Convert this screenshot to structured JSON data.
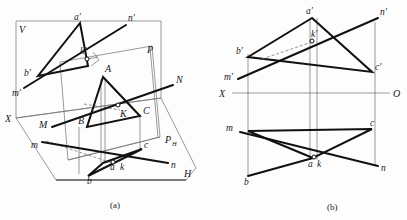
{
  "figure": {
    "title": "",
    "captions": [
      {
        "id": "caption-a",
        "text": "(a)",
        "x": 116,
        "y": 205
      },
      {
        "id": "caption-b",
        "text": "(b)",
        "x": 332,
        "y": 207
      }
    ]
  },
  "colors": {
    "background": "#fdfdfd",
    "thin_line": "#6f6f6f",
    "medium_line": "#2b2b2b",
    "heavy_line": "#111111",
    "hidden_line": "#7a7a7a",
    "text": "#1a1a1a"
  },
  "diagram_a": {
    "name": "pictorial-projection-view",
    "description": "Pictorial view showing V plane, H plane, auxiliary plane P, triangle ABC, line MN and intersection point K",
    "plane_labels": [
      {
        "id": "label-V",
        "text": "V",
        "x": 19,
        "y": 30
      },
      {
        "id": "label-H",
        "text": "H",
        "x": 184,
        "y": 177
      },
      {
        "id": "label-X",
        "text": "X",
        "x": 6,
        "y": 120
      },
      {
        "id": "label-P",
        "text": "P",
        "x": 148,
        "y": 51
      },
      {
        "id": "label-PH",
        "text": "P",
        "x": 167,
        "y": 141,
        "sub": "H"
      }
    ],
    "space_points": [
      {
        "id": "point-A",
        "text": "A",
        "x": 102,
        "y": 72
      },
      {
        "id": "point-B",
        "text": "B",
        "x": 81,
        "y": 121
      },
      {
        "id": "point-C",
        "text": "C",
        "x": 142,
        "y": 112
      },
      {
        "id": "point-K",
        "text": "K",
        "x": 123,
        "y": 113
      },
      {
        "id": "point-M",
        "text": "M",
        "x": 42,
        "y": 125
      },
      {
        "id": "point-N",
        "text": "N",
        "x": 176,
        "y": 89
      }
    ],
    "v_projection_points": [
      {
        "id": "point-a-prime",
        "text": "a′",
        "x": 76,
        "y": 17
      },
      {
        "id": "point-b-prime",
        "text": "b′",
        "x": 26,
        "y": 73
      },
      {
        "id": "point-k-prime",
        "text": "k′",
        "x": 80,
        "y": 58
      },
      {
        "id": "point-m-prime",
        "text": "m′",
        "x": 14,
        "y": 93
      },
      {
        "id": "point-n-prime",
        "text": "n′",
        "x": 129,
        "y": 18
      }
    ],
    "h_projection_points": [
      {
        "id": "point-a-lower",
        "text": "a",
        "x": 114,
        "y": 166
      },
      {
        "id": "point-k-lower",
        "text": "k",
        "x": 123,
        "y": 166
      },
      {
        "id": "point-b-lower",
        "text": "b",
        "x": 90,
        "y": 180
      },
      {
        "id": "point-c-lower",
        "text": "c",
        "x": 145,
        "y": 152
      },
      {
        "id": "point-m-lower",
        "text": "m",
        "x": 33,
        "y": 146
      },
      {
        "id": "point-n-lower",
        "text": "n",
        "x": 172,
        "y": 168
      }
    ]
  },
  "diagram_b": {
    "name": "orthographic-projection-view",
    "description": "Two-view orthographic projection: front (V) view above X-O axis and top (H) view below",
    "axis": {
      "id": "axis-XO",
      "left_label": "X",
      "right_label": "O",
      "left_label_x": 221,
      "right_label_x": 394,
      "label_y": 96,
      "y": 93,
      "x_start": 232,
      "x_end": 390
    },
    "v_projection_points": [
      {
        "id": "point-a-prime",
        "text": "a′",
        "x": 307,
        "y": 12
      },
      {
        "id": "point-b-prime",
        "text": "b′",
        "x": 239,
        "y": 50
      },
      {
        "id": "point-c-prime",
        "text": "c′",
        "x": 378,
        "y": 63
      },
      {
        "id": "point-k-prime",
        "text": "k′",
        "x": 315,
        "y": 37
      },
      {
        "id": "point-m-prime",
        "text": "m′",
        "x": 227,
        "y": 76
      },
      {
        "id": "point-n-prime",
        "text": "n′",
        "x": 382,
        "y": 12
      }
    ],
    "h_projection_points": [
      {
        "id": "point-a-lower",
        "text": "a",
        "x": 312,
        "y": 161
      },
      {
        "id": "point-k-lower",
        "text": "k",
        "x": 322,
        "y": 161
      },
      {
        "id": "point-b-lower",
        "text": "b",
        "x": 245,
        "y": 180
      },
      {
        "id": "point-c-lower",
        "text": "c",
        "x": 372,
        "y": 124
      },
      {
        "id": "point-m-lower",
        "text": "m",
        "x": 228,
        "y": 127
      },
      {
        "id": "point-n-lower",
        "text": "n",
        "x": 385,
        "y": 169
      }
    ]
  }
}
